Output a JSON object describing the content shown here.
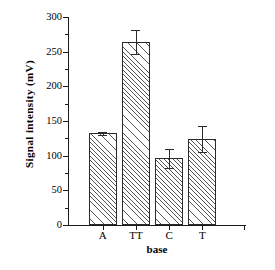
{
  "chart_data": {
    "type": "bar",
    "title": "",
    "subtitle": "",
    "xlabel": "base",
    "ylabel": "Signal intensity  (mV)",
    "categories": [
      "A",
      "TT",
      "C",
      "T"
    ],
    "values": [
      132,
      264,
      96,
      124
    ],
    "errors": [
      2,
      17,
      14,
      19
    ],
    "ylim": [
      0,
      300
    ],
    "ytick_labels": [
      "0",
      "50",
      "100",
      "150",
      "200",
      "250",
      "300"
    ],
    "ytick_values": [
      0,
      50,
      100,
      150,
      200,
      250,
      300
    ],
    "yminor_tick_values": [
      25,
      75,
      125,
      175,
      225,
      275
    ],
    "xtick_labels": [
      "A",
      "TT",
      "C",
      "T"
    ],
    "grid": false,
    "legend": null,
    "legend_position": "none",
    "bar_fill": "hatched-diagonal",
    "bar_edge_color": "#2b2b2b",
    "axis_color": "#1a1a1a",
    "background_color": "#ffffff",
    "annotations": []
  }
}
